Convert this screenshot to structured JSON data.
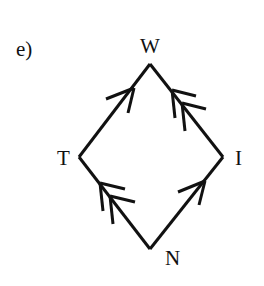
{
  "figure_label": "e)",
  "colors": {
    "stroke": "#111111",
    "background": "#ffffff"
  },
  "nodes": [
    {
      "id": "W",
      "label": "W",
      "x": 150,
      "y": 64
    },
    {
      "id": "T",
      "label": "T",
      "x": 79,
      "y": 157
    },
    {
      "id": "I",
      "label": "I",
      "x": 223,
      "y": 157
    },
    {
      "id": "N",
      "label": "N",
      "x": 150,
      "y": 249
    }
  ],
  "edges": [
    {
      "from": "T",
      "to": "W",
      "arrows": 1
    },
    {
      "from": "I",
      "to": "W",
      "arrows": 2
    },
    {
      "from": "N",
      "to": "T",
      "arrows": 2
    },
    {
      "from": "N",
      "to": "I",
      "arrows": 1
    }
  ]
}
